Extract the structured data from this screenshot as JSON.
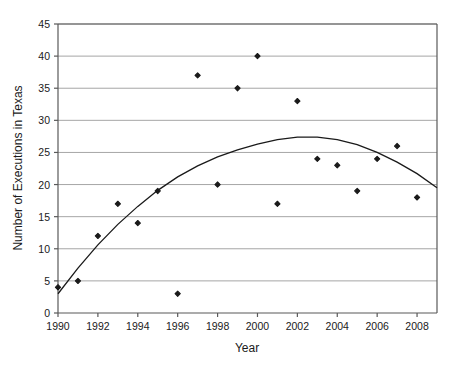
{
  "chart_data": {
    "type": "scatter",
    "title": "",
    "xlabel": "Year",
    "ylabel": "Number of Executions in Texas",
    "xlim": [
      1990,
      2009
    ],
    "ylim": [
      0,
      45
    ],
    "yticks": [
      0,
      5,
      10,
      15,
      20,
      25,
      30,
      35,
      40,
      45
    ],
    "xticks": [
      1990,
      1992,
      1994,
      1996,
      1998,
      2000,
      2002,
      2004,
      2006,
      2008
    ],
    "grid": "horizontal",
    "legend": "none",
    "x": [
      1990,
      1991,
      1992,
      1993,
      1994,
      1995,
      1996,
      1997,
      1998,
      1999,
      2000,
      2001,
      2002,
      2003,
      2004,
      2005,
      2006,
      2007,
      2008
    ],
    "values": [
      4,
      5,
      12,
      17,
      14,
      19,
      3,
      37,
      20,
      35,
      40,
      17,
      33,
      24,
      23,
      19,
      24,
      26,
      18
    ],
    "series": [
      {
        "name": "Executions",
        "type": "scatter",
        "marker": "diamond",
        "color": "#1a1a1a",
        "values": [
          4,
          5,
          12,
          17,
          14,
          19,
          3,
          37,
          20,
          35,
          40,
          17,
          33,
          24,
          23,
          19,
          24,
          26,
          18
        ]
      },
      {
        "name": "Quadratic trend curve",
        "type": "line",
        "color": "#1a1a1a",
        "fit": "quadratic",
        "x": [
          1990,
          1991,
          1992,
          1993,
          1994,
          1995,
          1996,
          1997,
          1998,
          1999,
          2000,
          2001,
          2002,
          2003,
          2004,
          2005,
          2006,
          2007,
          2008,
          2009
        ],
        "values": [
          3.0,
          7.0,
          10.6,
          13.8,
          16.6,
          19.1,
          21.2,
          22.9,
          24.3,
          25.4,
          26.3,
          27.0,
          27.4,
          27.4,
          27.0,
          26.2,
          25.0,
          23.5,
          21.7,
          19.5
        ]
      }
    ],
    "colors": {
      "marker": "#1a1a1a",
      "curve": "#1a1a1a",
      "gridline": "#a6a6a6",
      "axis": "#595959",
      "plot_background": "#ffffff"
    }
  },
  "axes": {
    "y_tick_labels": [
      "0",
      "5",
      "10",
      "15",
      "20",
      "25",
      "30",
      "35",
      "40",
      "45"
    ],
    "x_tick_labels": [
      "1990",
      "1992",
      "1994",
      "1996",
      "1998",
      "2000",
      "2002",
      "2004",
      "2006",
      "2008"
    ],
    "y_axis_title": "Number of Executions in Texas",
    "x_axis_title": "Year"
  }
}
